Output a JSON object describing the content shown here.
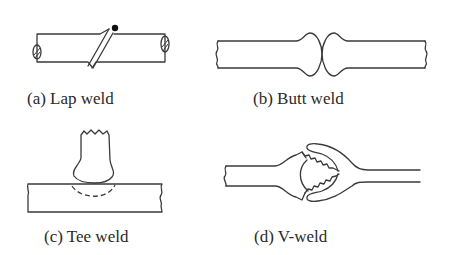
{
  "figure": {
    "panels": [
      {
        "id": "a",
        "label": "(a) Lap weld"
      },
      {
        "id": "b",
        "label": "(b) Butt weld"
      },
      {
        "id": "c",
        "label": "(c) Tee weld"
      },
      {
        "id": "d",
        "label": "(d) V-weld"
      }
    ],
    "colors": {
      "line": "#3a3a3a",
      "text": "#2a2a2a",
      "background": "#ffffff"
    }
  }
}
